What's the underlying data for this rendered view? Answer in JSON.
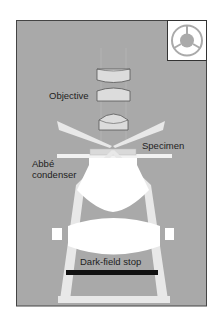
{
  "diagram": {
    "labels": {
      "objective": "Objective",
      "specimen": "Specimen",
      "condenser_line1": "Abbé",
      "condenser_line2": "condenser",
      "stop": "Dark-field stop"
    },
    "inset": {
      "description": "Dark-field stop (patch stop) top view",
      "icon": "patch-stop-icon"
    },
    "colors": {
      "background": "#a9a9a9",
      "panel_border": "#444444",
      "lens_fill": "#dcdcdc",
      "lens_stroke": "#555555",
      "light_beam": "#e8e8e8",
      "condenser_fill": "#ffffff",
      "stop_bar": "#111111",
      "text": "#222222"
    }
  }
}
